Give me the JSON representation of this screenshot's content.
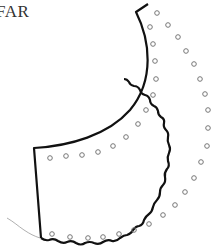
{
  "diagram": {
    "title_fragment": "FAR",
    "piece": "sewing-pattern-collar-piece",
    "colors": {
      "outline": "#111111",
      "holes": "#777777",
      "thread": "#aaaaaa",
      "text": "#333333"
    }
  }
}
